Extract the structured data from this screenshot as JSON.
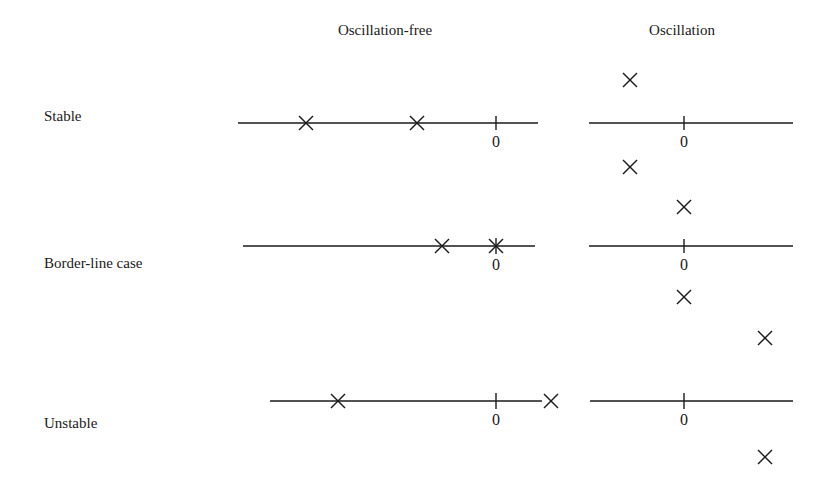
{
  "columns": {
    "oscillation_free": "Oscillation-free",
    "oscillation": "Oscillation"
  },
  "rows": [
    {
      "label": "Stable"
    },
    {
      "label": "Border-line case"
    },
    {
      "label": "Unstable"
    }
  ],
  "axis_origin_label": "0",
  "marker_glyph": "×",
  "line_color": "#1a1a1a"
}
